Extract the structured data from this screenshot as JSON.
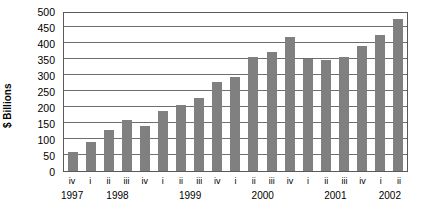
{
  "chart_data": {
    "type": "bar",
    "title": "",
    "subtitle": "",
    "xlabel": "",
    "ylabel": "$ Billions",
    "ylim": [
      0,
      500
    ],
    "ytick_step": 50,
    "yticks": [
      500,
      450,
      400,
      350,
      300,
      250,
      200,
      150,
      100,
      50,
      0
    ],
    "grid": true,
    "legend": false,
    "legend_position": "none",
    "bar_color": "#808080",
    "plot_border_color": "#5a5a5a",
    "gridline_color": "#6e6e6e",
    "categories": [
      "iv",
      "i",
      "ii",
      "iii",
      "iv",
      "i",
      "ii",
      "iii",
      "iv",
      "i",
      "ii",
      "iii",
      "iv",
      "i",
      "ii",
      "iii",
      "iv",
      "i",
      "ii"
    ],
    "values": [
      58,
      90,
      128,
      158,
      142,
      188,
      207,
      228,
      278,
      295,
      355,
      372,
      420,
      350,
      348,
      355,
      392,
      425,
      475
    ],
    "year_groups": [
      {
        "label": "1997",
        "quarters": [
          "iv"
        ],
        "start_index": 0,
        "count": 1
      },
      {
        "label": "1998",
        "quarters": [
          "i",
          "ii",
          "iii",
          "iv"
        ],
        "start_index": 1,
        "count": 4
      },
      {
        "label": "1999",
        "quarters": [
          "i",
          "ii",
          "iii",
          "iv"
        ],
        "start_index": 5,
        "count": 4
      },
      {
        "label": "2000",
        "quarters": [
          "i",
          "ii",
          "iii",
          "iv"
        ],
        "start_index": 9,
        "count": 4
      },
      {
        "label": "2001",
        "quarters": [
          "i",
          "ii",
          "iii",
          "iv"
        ],
        "start_index": 13,
        "count": 4
      },
      {
        "label": "2002",
        "quarters": [
          "i",
          "ii"
        ],
        "start_index": 17,
        "count": 2
      }
    ],
    "series": [
      {
        "name": "$ Billions",
        "values": [
          58,
          90,
          128,
          158,
          142,
          188,
          207,
          228,
          278,
          295,
          355,
          372,
          420,
          350,
          348,
          355,
          392,
          425,
          475
        ]
      }
    ]
  }
}
